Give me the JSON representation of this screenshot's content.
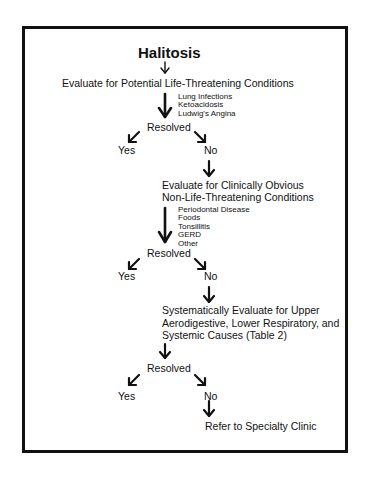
{
  "diagram": {
    "title": "Halitosis",
    "steps": [
      {
        "label": "Evaluate for Potential Life-Threatening Conditions",
        "considerations": [
          "Lung Infections",
          "Ketoacidosis",
          "Ludwig's Angina"
        ],
        "decision": "Resolved",
        "yes": "Yes",
        "no": "No"
      },
      {
        "label_lines": [
          "Evaluate for Clinically Obvious",
          "Non-Life-Threatening Conditions"
        ],
        "considerations": [
          "Periodontal Disease",
          "Foods",
          "Tonsillitis",
          "GERD",
          "Other"
        ],
        "decision": "Resolved",
        "yes": "Yes",
        "no": "No"
      },
      {
        "label_lines": [
          "Systematically Evaluate for Upper",
          "Aerodigestive, Lower Respiratory, and",
          "Systemic Causes (Table 2)"
        ],
        "decision": "Resolved",
        "yes": "Yes",
        "no": "No"
      }
    ],
    "final": "Refer to Specialty Clinic"
  }
}
